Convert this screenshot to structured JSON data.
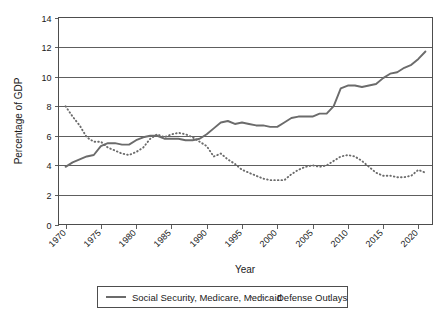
{
  "chart_data": {
    "type": "line",
    "title": "",
    "xlabel": "Year",
    "ylabel": "Percentage of GDP",
    "xlim": [
      1969,
      2022
    ],
    "ylim": [
      0,
      14
    ],
    "ytick_step": 2,
    "yticks": [
      "0",
      "2",
      "4",
      "6",
      "8",
      "10",
      "12",
      "14"
    ],
    "xticks": [
      "1970",
      "1975",
      "1980",
      "1985",
      "1990",
      "1995",
      "2000",
      "2005",
      "2010",
      "2015",
      "2020"
    ],
    "grid": "horizontal",
    "legend_position": "bottom",
    "x": [
      1970,
      1971,
      1972,
      1973,
      1974,
      1975,
      1976,
      1977,
      1978,
      1979,
      1980,
      1981,
      1982,
      1983,
      1984,
      1985,
      1986,
      1987,
      1988,
      1989,
      1990,
      1991,
      1992,
      1993,
      1994,
      1995,
      1996,
      1997,
      1998,
      1999,
      2000,
      2001,
      2002,
      2003,
      2004,
      2005,
      2006,
      2007,
      2008,
      2009,
      2010,
      2011,
      2012,
      2013,
      2014,
      2015,
      2016,
      2017,
      2018,
      2019,
      2020,
      2021
    ],
    "series": [
      {
        "name": "Social Security, Medicare, Medicaid",
        "style": "solid",
        "color": "#6b6b6b",
        "values": [
          3.9,
          4.2,
          4.4,
          4.6,
          4.7,
          5.3,
          5.5,
          5.5,
          5.4,
          5.4,
          5.7,
          5.9,
          6.0,
          6.0,
          5.8,
          5.8,
          5.8,
          5.7,
          5.7,
          5.8,
          6.1,
          6.5,
          6.9,
          7.0,
          6.8,
          6.9,
          6.8,
          6.7,
          6.7,
          6.6,
          6.6,
          6.9,
          7.2,
          7.3,
          7.3,
          7.3,
          7.5,
          7.5,
          8.0,
          9.2,
          9.4,
          9.4,
          9.3,
          9.4,
          9.5,
          9.9,
          10.2,
          10.3,
          10.6,
          10.8,
          11.2,
          11.7
        ]
      },
      {
        "name": "Defense Outlays",
        "style": "dotted",
        "color": "#6b6b6b",
        "values": [
          8.0,
          7.3,
          6.7,
          5.9,
          5.6,
          5.6,
          5.2,
          5.0,
          4.8,
          4.7,
          4.9,
          5.2,
          5.8,
          6.1,
          5.9,
          6.1,
          6.2,
          6.1,
          5.9,
          5.6,
          5.3,
          4.6,
          4.8,
          4.4,
          4.1,
          3.7,
          3.5,
          3.3,
          3.1,
          3.0,
          3.0,
          3.0,
          3.4,
          3.7,
          3.9,
          4.0,
          3.9,
          4.0,
          4.3,
          4.6,
          4.7,
          4.6,
          4.3,
          3.9,
          3.5,
          3.3,
          3.3,
          3.2,
          3.2,
          3.3,
          3.7,
          3.5
        ]
      }
    ]
  },
  "legend": {
    "items": [
      {
        "label": "Social Security, Medicare, Medicaid",
        "style": "solid"
      },
      {
        "label": "Defense Outlays",
        "style": "dotted"
      }
    ]
  }
}
